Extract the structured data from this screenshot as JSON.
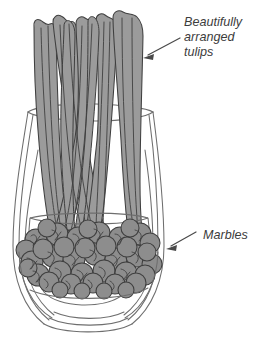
{
  "illustration": {
    "title": "Glass vase with tulip stems and marbles",
    "background_color": "#ffffff",
    "palette": {
      "stem_fill": "#9b9b9b",
      "stem_stroke": "#3f3f3f",
      "marble_fill": "#8d8d8d",
      "marble_stroke": "#3f3f3f",
      "glass_stroke": "#6e6e6e",
      "text_color": "#3c3c3c",
      "arrow_color": "#4a4a4a"
    },
    "annotations": [
      {
        "id": "tulips",
        "lines": [
          "Beautifully",
          "arranged",
          "tulips"
        ],
        "text_x": 184,
        "text_y": 26,
        "line_height": 15,
        "arrow_from_x": 180,
        "arrow_from_y": 38,
        "arrow_to_x": 143,
        "arrow_to_y": 58
      },
      {
        "id": "marbles",
        "lines": [
          "Marbles"
        ],
        "text_x": 203,
        "text_y": 239,
        "line_height": 15,
        "arrow_from_x": 196,
        "arrow_from_y": 232,
        "arrow_to_x": 166,
        "arrow_to_y": 249
      }
    ],
    "vase": {
      "rim_y": 112,
      "rim_left_x": 28,
      "rim_right_x": 153,
      "water_line_y": 218,
      "marble_top_y": 222,
      "marble_bottom_y": 296,
      "base_y": 330,
      "widest_y": 250
    },
    "stems": {
      "count": 9,
      "top_y": 14,
      "bottom_y": 230
    },
    "marbles": {
      "count": 52
    }
  }
}
